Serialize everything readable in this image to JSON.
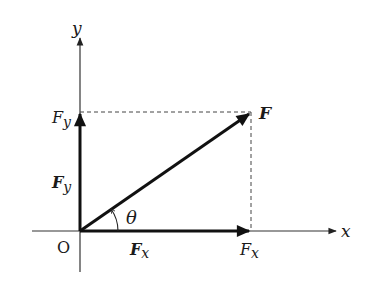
{
  "diagram": {
    "axes": {
      "x_label": "x",
      "y_label": "y",
      "origin_label": "O"
    },
    "vectors": {
      "resultant": {
        "label": "F"
      },
      "x_component": {
        "label": "F",
        "subscript": "x"
      },
      "y_component": {
        "label": "F",
        "subscript": "y"
      }
    },
    "axis_ticks": {
      "x_tick": {
        "label": "F",
        "subscript": "x"
      },
      "y_tick": {
        "label": "F",
        "subscript": "y"
      }
    },
    "angle": {
      "label": "θ"
    },
    "colors": {
      "ink": "#1a1a1a",
      "axis": "#333333",
      "dash": "#444444"
    }
  }
}
